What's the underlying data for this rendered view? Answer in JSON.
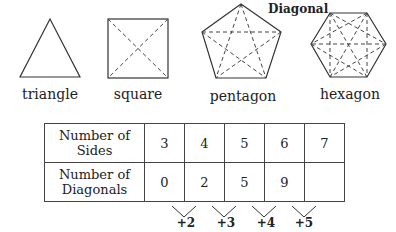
{
  "shapes": [
    {
      "name": "triangle",
      "sides": 3
    },
    {
      "name": "square",
      "sides": 4
    },
    {
      "name": "pentagon",
      "sides": 5
    },
    {
      "name": "hexagon",
      "sides": 6
    }
  ],
  "annotation": "Diagonal",
  "table": {
    "row_headers": [
      [
        "Number of",
        "Sides"
      ],
      [
        "Number of",
        "Diagonals"
      ]
    ],
    "sides": [
      "3",
      "4",
      "5",
      "6",
      "7"
    ],
    "diagonals": [
      "0",
      "2",
      "5",
      "9",
      ""
    ]
  },
  "increments": [
    "+2",
    "+3",
    "+4",
    "+5"
  ]
}
